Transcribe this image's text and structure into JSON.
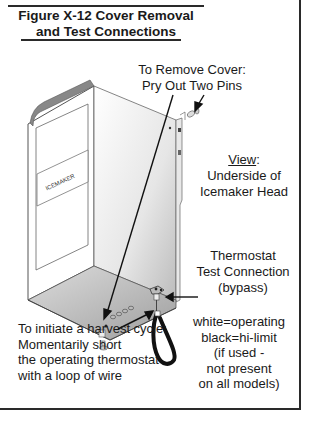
{
  "figure": {
    "title_line1": "Figure X-12 Cover Removal",
    "title_line2": "and Test Connections"
  },
  "callouts": {
    "remove_cover": {
      "line1": "To Remove Cover:",
      "line2": "Pry Out Two Pins"
    },
    "view": {
      "label": "View",
      "suffix": ":",
      "line2": "Underside of",
      "line3": "Icemaker Head"
    },
    "thermostat": {
      "line1": "Thermostat",
      "line2": "Test Connection",
      "line3": "(bypass)"
    },
    "harvest": {
      "line1": "To initiate a harvest cycle:",
      "line2": "Momentarily short",
      "line3": "the operating thermostat",
      "line4": "with a loop of wire"
    },
    "wire_colors": {
      "line1": "white=operating",
      "line2": "black=hi-limit",
      "line3": "(if used -",
      "line4": "not present",
      "line5": "on all models)"
    }
  },
  "device": {
    "panel_label": "ICEMAKER"
  },
  "colors": {
    "ink": "#1a1a1a",
    "frame": "#2a2a2a",
    "metal_light": "#f2f2f2",
    "metal_dark": "#bdbdbd"
  }
}
